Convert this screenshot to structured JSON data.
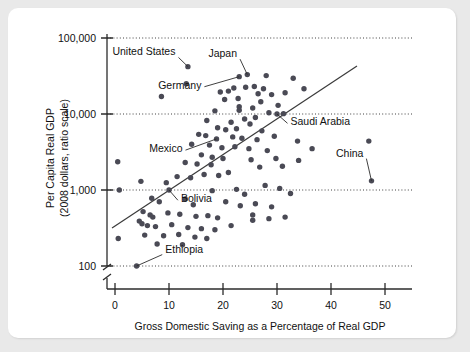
{
  "figure": {
    "background_color": "#e9e9e9",
    "panel_color": "#ffffff",
    "marker_color": "#4a4a55",
    "axis_color": "#2b2b2b"
  },
  "chart_data": {
    "type": "scatter",
    "title": "",
    "xlabel": "Gross Domestic Saving as a Percentage of Real GDP",
    "ylabel": "Per Capita Real GDP\n(2008 dollars, ratio scale)",
    "ylabel_line1": "Per Capita Real GDP",
    "ylabel_line2": "(2008 dollars, ratio scale)",
    "yscale": "log",
    "xscale": "linear",
    "xlim": [
      -2,
      56
    ],
    "ylim": [
      100,
      100000
    ],
    "xticks": [
      0,
      10,
      20,
      30,
      40,
      50
    ],
    "xticklabels": [
      "0",
      "10",
      "20",
      "30",
      "40",
      "50"
    ],
    "yticks": [
      100,
      1000,
      10000,
      100000
    ],
    "yticklabels": [
      "100",
      "1,000",
      "10,000",
      "100,000"
    ],
    "grid": "horizontal-dotted",
    "axis_break": true,
    "axis_break_note": "double slash on y-axis below 100",
    "legend": "none",
    "trend_line": {
      "label": "fitted trend line",
      "x_start": 1.5,
      "y_start": 305,
      "x_end": 43.0,
      "y_end": 39000
    },
    "annotations": [
      {
        "label": "United States",
        "x": 13.5,
        "y": 42000,
        "text_x": 11.2,
        "text_y": 59000
      },
      {
        "label": "Japan",
        "x": 24.5,
        "y": 33000,
        "text_x": 22.6,
        "text_y": 56000
      },
      {
        "label": "Germany",
        "x": 23.0,
        "y": 31000,
        "text_x": 16.0,
        "text_y": 21500
      },
      {
        "label": "Saudi Arabia",
        "x": 30.0,
        "y": 10000,
        "text_x": 32.5,
        "text_y": 7100
      },
      {
        "label": "Mexico",
        "x": 18.8,
        "y": 4700,
        "text_x": 12.5,
        "text_y": 3150
      },
      {
        "label": "China",
        "x": 47.5,
        "y": 1320,
        "text_x": 46.0,
        "text_y": 2750
      },
      {
        "label": "Bolivia",
        "x": 10.0,
        "y": 1000,
        "text_x": 12.2,
        "text_y": 690
      },
      {
        "label": "Ethiopia",
        "x": 4.0,
        "y": 100,
        "text_x": 9.3,
        "text_y": 150
      }
    ],
    "points": [
      {
        "x": 13.5,
        "y": 42000
      },
      {
        "x": 13.2,
        "y": 25000
      },
      {
        "x": 8.6,
        "y": 17000
      },
      {
        "x": 24.5,
        "y": 33000
      },
      {
        "x": 28.0,
        "y": 32000
      },
      {
        "x": 33.0,
        "y": 29500
      },
      {
        "x": 23.0,
        "y": 31000
      },
      {
        "x": 22.0,
        "y": 22000
      },
      {
        "x": 24.2,
        "y": 22500
      },
      {
        "x": 25.8,
        "y": 23000
      },
      {
        "x": 27.5,
        "y": 21500
      },
      {
        "x": 35.0,
        "y": 21500
      },
      {
        "x": 19.5,
        "y": 19500
      },
      {
        "x": 21.0,
        "y": 20000
      },
      {
        "x": 26.5,
        "y": 18500
      },
      {
        "x": 29.0,
        "y": 18000
      },
      {
        "x": 31.5,
        "y": 19000
      },
      {
        "x": 20.3,
        "y": 15500
      },
      {
        "x": 22.8,
        "y": 16000
      },
      {
        "x": 27.0,
        "y": 14500
      },
      {
        "x": 23.0,
        "y": 12500
      },
      {
        "x": 23.0,
        "y": 11200
      },
      {
        "x": 25.5,
        "y": 12000
      },
      {
        "x": 30.2,
        "y": 13000
      },
      {
        "x": 18.5,
        "y": 11000
      },
      {
        "x": 28.5,
        "y": 10400
      },
      {
        "x": 30.0,
        "y": 10000
      },
      {
        "x": 26.0,
        "y": 9000
      },
      {
        "x": 31.2,
        "y": 10100
      },
      {
        "x": 17.0,
        "y": 8200
      },
      {
        "x": 21.5,
        "y": 7800
      },
      {
        "x": 24.0,
        "y": 8600
      },
      {
        "x": 25.0,
        "y": 7400
      },
      {
        "x": 19.0,
        "y": 6600
      },
      {
        "x": 20.5,
        "y": 6200
      },
      {
        "x": 22.5,
        "y": 6400
      },
      {
        "x": 27.2,
        "y": 6000
      },
      {
        "x": 15.5,
        "y": 5400
      },
      {
        "x": 16.8,
        "y": 5200
      },
      {
        "x": 18.8,
        "y": 4700
      },
      {
        "x": 21.8,
        "y": 5000
      },
      {
        "x": 23.5,
        "y": 4800
      },
      {
        "x": 26.3,
        "y": 4600
      },
      {
        "x": 29.5,
        "y": 5100
      },
      {
        "x": 33.8,
        "y": 4400
      },
      {
        "x": 14.2,
        "y": 4000
      },
      {
        "x": 17.5,
        "y": 3900
      },
      {
        "x": 19.8,
        "y": 3600
      },
      {
        "x": 22.2,
        "y": 3700
      },
      {
        "x": 24.8,
        "y": 3500
      },
      {
        "x": 28.2,
        "y": 3300
      },
      {
        "x": 36.5,
        "y": 3500
      },
      {
        "x": 47.0,
        "y": 4400
      },
      {
        "x": 16.0,
        "y": 2900
      },
      {
        "x": 18.0,
        "y": 2700
      },
      {
        "x": 20.0,
        "y": 2600
      },
      {
        "x": 25.2,
        "y": 2500
      },
      {
        "x": 29.8,
        "y": 2600
      },
      {
        "x": 34.0,
        "y": 2450
      },
      {
        "x": 13.0,
        "y": 2300
      },
      {
        "x": 15.2,
        "y": 2200
      },
      {
        "x": 17.8,
        "y": 2150
      },
      {
        "x": 26.8,
        "y": 2000
      },
      {
        "x": 31.0,
        "y": 2050
      },
      {
        "x": 0.5,
        "y": 2350
      },
      {
        "x": 4.8,
        "y": 1300
      },
      {
        "x": 9.5,
        "y": 1250
      },
      {
        "x": 11.5,
        "y": 1500
      },
      {
        "x": 14.0,
        "y": 1450
      },
      {
        "x": 16.5,
        "y": 1600
      },
      {
        "x": 19.2,
        "y": 1550
      },
      {
        "x": 21.0,
        "y": 1700
      },
      {
        "x": 27.8,
        "y": 1150
      },
      {
        "x": 30.5,
        "y": 1050
      },
      {
        "x": 47.5,
        "y": 1320
      },
      {
        "x": 0.8,
        "y": 1000
      },
      {
        "x": 10.0,
        "y": 1000
      },
      {
        "x": 18.0,
        "y": 980
      },
      {
        "x": 22.5,
        "y": 1020
      },
      {
        "x": 24.0,
        "y": 880
      },
      {
        "x": 32.5,
        "y": 900
      },
      {
        "x": 6.8,
        "y": 780
      },
      {
        "x": 8.2,
        "y": 700
      },
      {
        "x": 13.0,
        "y": 760
      },
      {
        "x": 14.5,
        "y": 640
      },
      {
        "x": 20.5,
        "y": 700
      },
      {
        "x": 23.2,
        "y": 620
      },
      {
        "x": 26.0,
        "y": 660
      },
      {
        "x": 29.0,
        "y": 600
      },
      {
        "x": 5.2,
        "y": 520
      },
      {
        "x": 6.5,
        "y": 470
      },
      {
        "x": 7.0,
        "y": 440
      },
      {
        "x": 9.8,
        "y": 500
      },
      {
        "x": 12.0,
        "y": 480
      },
      {
        "x": 15.0,
        "y": 450
      },
      {
        "x": 17.2,
        "y": 460
      },
      {
        "x": 19.0,
        "y": 430
      },
      {
        "x": 25.5,
        "y": 470
      },
      {
        "x": 25.5,
        "y": 400
      },
      {
        "x": 28.5,
        "y": 420
      },
      {
        "x": 31.5,
        "y": 440
      },
      {
        "x": 4.5,
        "y": 390
      },
      {
        "x": 5.0,
        "y": 360
      },
      {
        "x": 6.0,
        "y": 340
      },
      {
        "x": 7.5,
        "y": 330
      },
      {
        "x": 10.5,
        "y": 350
      },
      {
        "x": 13.5,
        "y": 320
      },
      {
        "x": 16.0,
        "y": 310
      },
      {
        "x": 18.5,
        "y": 300
      },
      {
        "x": 21.5,
        "y": 340
      },
      {
        "x": 5.5,
        "y": 255
      },
      {
        "x": 9.0,
        "y": 250
      },
      {
        "x": 11.8,
        "y": 260
      },
      {
        "x": 14.8,
        "y": 240
      },
      {
        "x": 17.0,
        "y": 230
      },
      {
        "x": 0.6,
        "y": 230
      },
      {
        "x": 7.8,
        "y": 195
      },
      {
        "x": 12.5,
        "y": 190
      },
      {
        "x": 4.0,
        "y": 100
      }
    ]
  }
}
